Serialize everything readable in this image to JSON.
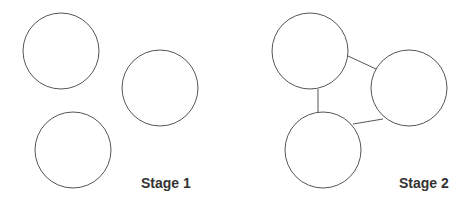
{
  "stages": [
    {
      "label": "Stage 1",
      "circles": [
        {
          "cx": 61,
          "cy": 51,
          "r": 38
        },
        {
          "cx": 160,
          "cy": 88,
          "r": 38
        },
        {
          "cx": 73,
          "cy": 150,
          "r": 38
        }
      ],
      "connections": []
    },
    {
      "label": "Stage 2",
      "circles": [
        {
          "cx": 310,
          "cy": 51,
          "r": 38
        },
        {
          "cx": 409,
          "cy": 88,
          "r": 38
        },
        {
          "cx": 323,
          "cy": 150,
          "r": 38
        }
      ],
      "connections": [
        {
          "from": 0,
          "to": 2
        },
        {
          "from": 0,
          "to": 1
        },
        {
          "from": 2,
          "to": 1
        }
      ]
    }
  ],
  "colors": {
    "stroke": "#555555",
    "text": "#333333",
    "background": "#ffffff"
  }
}
